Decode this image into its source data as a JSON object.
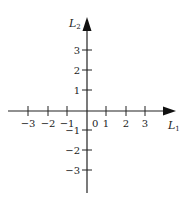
{
  "diagram": {
    "type": "cartesian-axes",
    "origin_px": {
      "x": 87,
      "y": 111
    },
    "unit_px": 19.6,
    "colors": {
      "axis": "#222222",
      "background": "#ffffff"
    },
    "x_axis": {
      "label_main": "L",
      "label_sub": "1",
      "ticks": [
        -3,
        -2,
        -1,
        1,
        2,
        3
      ],
      "tick_labels": [
        "−3",
        "−2",
        "−1",
        "1",
        "2",
        "3"
      ],
      "range": [
        -4,
        4.5
      ],
      "arrow": "right"
    },
    "y_axis": {
      "label_main": "L",
      "label_sub": "2",
      "ticks": [
        3,
        2,
        1,
        -1,
        -2,
        -3
      ],
      "tick_labels": [
        "3",
        "2",
        "1",
        "−1",
        "−2",
        "−3"
      ],
      "range": [
        -4.1,
        4.6
      ],
      "arrow": "up"
    },
    "origin_label": "0"
  }
}
